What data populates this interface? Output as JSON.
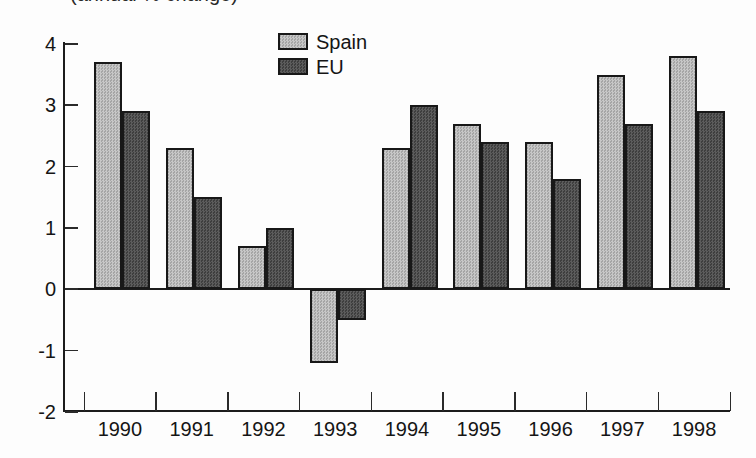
{
  "caption_partial": "(annual % change)",
  "chart_data": {
    "type": "bar",
    "categories": [
      "1990",
      "1991",
      "1992",
      "1993",
      "1994",
      "1995",
      "1996",
      "1997",
      "1998"
    ],
    "series": [
      {
        "name": "Spain",
        "color": "#b6b6b6",
        "values": [
          3.7,
          2.3,
          0.7,
          -1.2,
          2.3,
          2.7,
          2.4,
          3.5,
          3.8
        ]
      },
      {
        "name": "EU",
        "color": "#4e4e4e",
        "values": [
          2.9,
          1.5,
          1.0,
          -0.5,
          3.0,
          2.4,
          1.8,
          2.7,
          2.9
        ]
      }
    ],
    "xlabel": "",
    "ylabel": "",
    "ylim": [
      -2,
      4
    ],
    "yticks": [
      4,
      3,
      2,
      1,
      0,
      -1,
      -2
    ],
    "grid": false,
    "legend_position": "top-center",
    "baseline_value": 0
  },
  "colors": {
    "axis": "#1c1c1c",
    "text": "#151515",
    "background": "#fdfdfd",
    "spain_fill": "#b6b6b6",
    "eu_fill": "#4e4e4e",
    "bar_border": "#181818"
  }
}
